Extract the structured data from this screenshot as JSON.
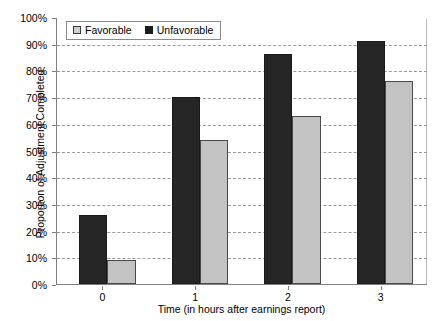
{
  "chart_data": {
    "type": "bar",
    "title": "",
    "xlabel": "Time (in hours after earnings report)",
    "ylabel": "Proportion of Adjustment Completed",
    "categories": [
      "0",
      "1",
      "2",
      "3"
    ],
    "series": [
      {
        "name": "Favorable",
        "values": [
          9,
          54,
          63,
          76
        ],
        "color": "#c3c3c3"
      },
      {
        "name": "Unfavorable",
        "values": [
          26,
          70,
          86,
          91
        ],
        "color": "#262626"
      }
    ],
    "ylim": [
      0,
      100
    ],
    "ytick_labels": [
      "100%",
      "90%",
      "80%",
      "70%",
      "60%",
      "50%",
      "40%",
      "30%",
      "20%",
      "10%",
      "0%"
    ],
    "ytick_values": [
      100,
      90,
      80,
      70,
      60,
      50,
      40,
      30,
      20,
      10,
      0
    ],
    "grid": true,
    "grid_style": "dashed-horizontal",
    "legend_position": "top-left-inside",
    "value_suffix": "%"
  },
  "legend": {
    "items": [
      {
        "label": "Favorable",
        "swatch": "favorable-swatch"
      },
      {
        "label": "Unfavorable",
        "swatch": "unfavorable-swatch"
      }
    ]
  },
  "colors": {
    "favorable": "#c3c3c3",
    "unfavorable": "#262626",
    "gridline": "#9a9a9a",
    "axis": "#808080",
    "background": "#ffffff"
  }
}
